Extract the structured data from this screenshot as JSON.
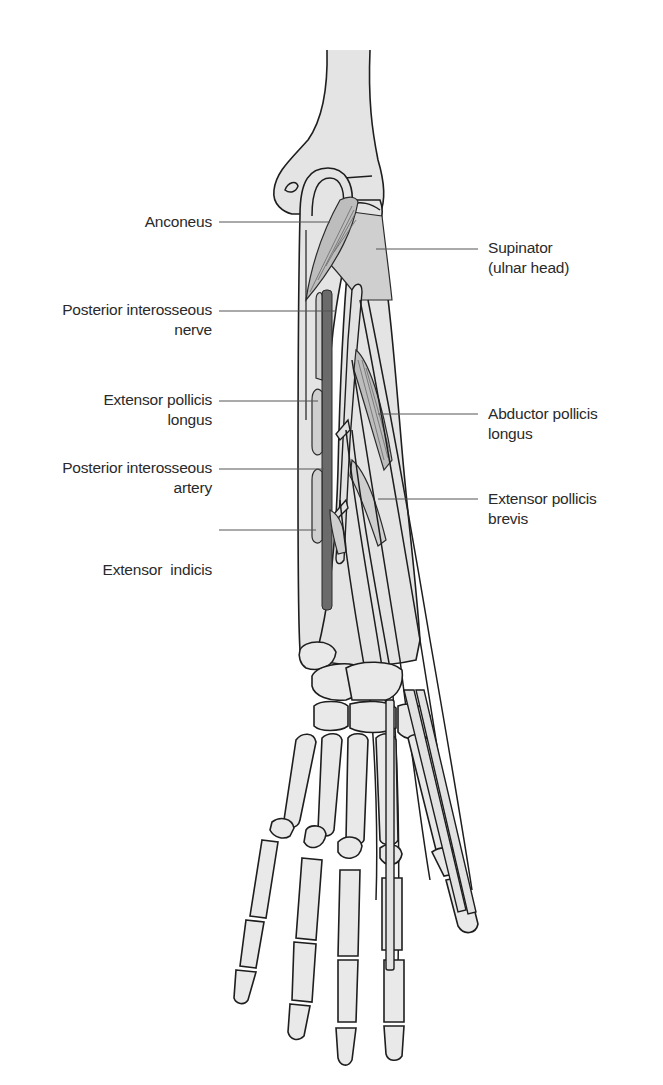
{
  "figure": {
    "colors": {
      "background": "#ffffff",
      "bone_fill": "#e4e4e4",
      "muscle_fill": "#bdbdbd",
      "nerve_artery_fill": "#6b6b6b",
      "outline": "#1e1e1e",
      "label_text": "#2a2a2a",
      "leader_line": "#555555"
    }
  },
  "labels": {
    "left": [
      {
        "id": "anconeus",
        "lines": [
          "Anconeus"
        ]
      },
      {
        "id": "posterior-interosseous-nerve",
        "lines": [
          "Posterior interosseous",
          "nerve"
        ]
      },
      {
        "id": "extensor-pollicis-longus",
        "lines": [
          "Extensor pollicis",
          "longus"
        ]
      },
      {
        "id": "posterior-interosseous-artery",
        "lines": [
          "Posterior interosseous",
          "artery"
        ]
      },
      {
        "id": "extensor-indicis",
        "lines": [
          "Extensor  indicis"
        ]
      }
    ],
    "right": [
      {
        "id": "supinator-ulnar-head",
        "lines": [
          "Supinator",
          "(ulnar head)"
        ]
      },
      {
        "id": "abductor-pollicis-longus",
        "lines": [
          "Abductor pollicis",
          "longus"
        ]
      },
      {
        "id": "extensor-pollicis-brevis",
        "lines": [
          "Extensor pollicis",
          "brevis"
        ]
      }
    ]
  }
}
